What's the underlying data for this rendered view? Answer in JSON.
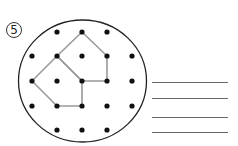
{
  "problem": {
    "number_label": "5"
  },
  "geoboard": {
    "boundary": {
      "cx": 82.5,
      "cy": 81,
      "rx": 64,
      "ry": 61,
      "stroke": "#222222"
    },
    "dot_color": "#111111",
    "dot_radius": 2.6,
    "dots": [
      [
        57,
        32
      ],
      [
        82,
        32
      ],
      [
        107,
        32
      ],
      [
        32,
        56
      ],
      [
        57,
        56
      ],
      [
        82,
        56
      ],
      [
        107,
        56
      ],
      [
        132,
        56
      ],
      [
        32,
        81
      ],
      [
        57,
        81
      ],
      [
        82,
        81
      ],
      [
        107,
        81
      ],
      [
        132,
        81
      ],
      [
        32,
        106
      ],
      [
        57,
        106
      ],
      [
        82,
        106
      ],
      [
        107,
        106
      ],
      [
        132,
        106
      ],
      [
        57,
        130
      ],
      [
        82,
        130
      ],
      [
        107,
        130
      ]
    ],
    "shape_color": "#9a9a9a",
    "shapes": [
      {
        "name": "upper-pentagon",
        "points": [
          [
            82,
            32
          ],
          [
            107,
            56
          ],
          [
            107,
            81
          ],
          [
            82,
            81
          ],
          [
            57,
            56
          ]
        ]
      },
      {
        "name": "lower-pentagon",
        "points": [
          [
            57,
            56
          ],
          [
            82,
            81
          ],
          [
            82,
            106
          ],
          [
            57,
            106
          ],
          [
            32,
            81
          ]
        ]
      }
    ]
  },
  "answer_lines": [
    {
      "y": 82,
      "x1": 152,
      "x2": 228
    },
    {
      "y": 98,
      "x1": 152,
      "x2": 228
    },
    {
      "y": 117,
      "x1": 152,
      "x2": 228
    },
    {
      "y": 132,
      "x1": 152,
      "x2": 228
    }
  ]
}
